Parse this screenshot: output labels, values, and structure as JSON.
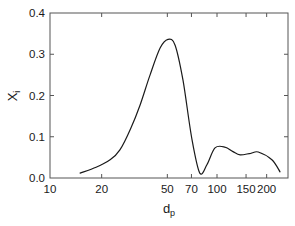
{
  "chart_data": {
    "type": "line",
    "title": "",
    "xlabel": "d",
    "xlabel_subscript": "p",
    "ylabel": "X",
    "ylabel_subscript": "i",
    "xscale": "log",
    "xlim": [
      10,
      270
    ],
    "ylim": [
      0.0,
      0.4
    ],
    "grid": false,
    "legend": null,
    "x_ticks": [
      10,
      20,
      50,
      70,
      100,
      150,
      200
    ],
    "x_tick_labels": [
      "10",
      "20",
      "50",
      "70",
      "100",
      "150",
      "200"
    ],
    "x_minor_ticks": [],
    "y_ticks": [
      0.0,
      0.1,
      0.2,
      0.3,
      0.4
    ],
    "y_tick_labels": [
      "0.0",
      "0.1",
      "0.2",
      "0.3",
      "0.4"
    ],
    "series": [
      {
        "name": "X_i",
        "color": "#1a1a1a",
        "x": [
          14.8,
          18.5,
          22.5,
          25.8,
          30.0,
          34.2,
          39.3,
          45.2,
          50.5,
          55.7,
          62.2,
          70.6,
          78.7,
          86.9,
          97.3,
          111.7,
          125.0,
          138.0,
          160.0,
          178.0,
          215.0,
          241.0
        ],
        "values": [
          0.012,
          0.026,
          0.044,
          0.068,
          0.12,
          0.177,
          0.25,
          0.315,
          0.336,
          0.322,
          0.237,
          0.092,
          0.012,
          0.032,
          0.073,
          0.075,
          0.064,
          0.056,
          0.06,
          0.063,
          0.044,
          0.015
        ]
      }
    ]
  }
}
